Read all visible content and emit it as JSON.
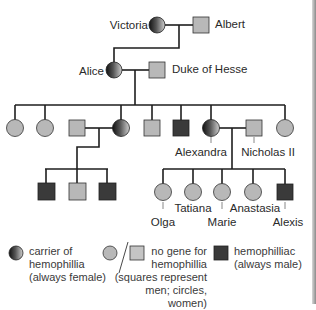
{
  "colors": {
    "unaffected_fill": "#b8b8b8",
    "hemophiliac_fill": "#3a3a3a",
    "line": "#1e1e1e",
    "carrier_dark": "#1a1a1a",
    "carrier_light": "#c4c4c4"
  },
  "people": {
    "victoria": {
      "name": "Victoria",
      "status": "carrier",
      "sex": "female"
    },
    "albert": {
      "name": "Albert",
      "status": "no gene",
      "sex": "male"
    },
    "alice": {
      "name": "Alice",
      "status": "carrier",
      "sex": "female"
    },
    "duke": {
      "name": "Duke of Hesse",
      "status": "no gene",
      "sex": "male"
    },
    "alexandra": {
      "name": "Alexandra",
      "status": "carrier",
      "sex": "female"
    },
    "nicholas": {
      "name": "Nicholas II",
      "status": "no gene",
      "sex": "male"
    },
    "olga": {
      "name": "Olga",
      "status": "no gene",
      "sex": "female"
    },
    "tatiana": {
      "name": "Tatiana",
      "status": "no gene",
      "sex": "female"
    },
    "marie": {
      "name": "Marie",
      "status": "no gene",
      "sex": "female"
    },
    "anastasia": {
      "name": "Anastasia",
      "status": "no gene",
      "sex": "female"
    },
    "alexis": {
      "name": "Alexis",
      "status": "hemophiliac",
      "sex": "male"
    }
  },
  "generation2": [
    {
      "sex": "female",
      "status": "no gene"
    },
    {
      "sex": "female",
      "status": "no gene"
    },
    {
      "sex": "male",
      "status": "no gene",
      "note": "spouse"
    },
    {
      "sex": "female",
      "status": "carrier"
    },
    {
      "sex": "male",
      "status": "no gene"
    },
    {
      "sex": "male",
      "status": "hemophiliac"
    },
    {
      "sex": "female",
      "status": "carrier",
      "name": "Alexandra"
    },
    {
      "sex": "male",
      "status": "no gene",
      "name": "Nicholas II",
      "note": "spouse"
    },
    {
      "sex": "female",
      "status": "no gene"
    }
  ],
  "generation3_left": [
    {
      "sex": "male",
      "status": "hemophiliac"
    },
    {
      "sex": "male",
      "status": "no gene"
    },
    {
      "sex": "male",
      "status": "hemophiliac"
    }
  ],
  "legend": {
    "carrier": {
      "line1": "carrier of",
      "line2": "hemophillia",
      "line3": "(always female)"
    },
    "no_gene": {
      "line1": "no gene for",
      "line2": "hemophillia",
      "line3": "(squares represent",
      "line4": "men; circles, women)"
    },
    "hemophiliac": {
      "line1": "hemophilliac",
      "line2": "(always male)"
    }
  }
}
